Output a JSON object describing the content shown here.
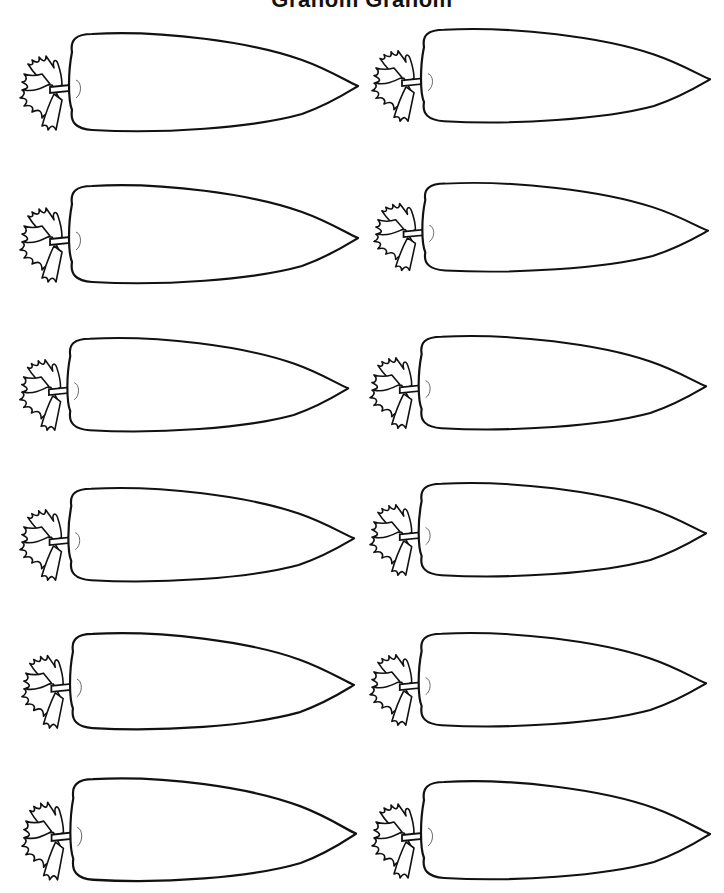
{
  "worksheet": {
    "title": "Granom Granom",
    "rows": 6,
    "columns": 2,
    "item_icon": "carrot-outline",
    "stroke_color": "#111111",
    "background_color": "#ffffff"
  },
  "carrots": [
    {
      "row": 1,
      "col": 1,
      "x": 12,
      "y": 30,
      "w": 350,
      "h": 105
    },
    {
      "row": 1,
      "col": 2,
      "x": 364,
      "y": 26,
      "w": 350,
      "h": 100
    },
    {
      "row": 2,
      "col": 1,
      "x": 12,
      "y": 182,
      "w": 350,
      "h": 105
    },
    {
      "row": 2,
      "col": 2,
      "x": 366,
      "y": 180,
      "w": 346,
      "h": 95
    },
    {
      "row": 3,
      "col": 1,
      "x": 12,
      "y": 335,
      "w": 340,
      "h": 100
    },
    {
      "row": 3,
      "col": 2,
      "x": 362,
      "y": 333,
      "w": 348,
      "h": 100
    },
    {
      "row": 4,
      "col": 1,
      "x": 12,
      "y": 485,
      "w": 346,
      "h": 100
    },
    {
      "row": 4,
      "col": 2,
      "x": 362,
      "y": 480,
      "w": 348,
      "h": 100
    },
    {
      "row": 5,
      "col": 1,
      "x": 14,
      "y": 630,
      "w": 344,
      "h": 103
    },
    {
      "row": 5,
      "col": 2,
      "x": 362,
      "y": 630,
      "w": 348,
      "h": 100
    },
    {
      "row": 6,
      "col": 1,
      "x": 14,
      "y": 775,
      "w": 346,
      "h": 110
    },
    {
      "row": 6,
      "col": 2,
      "x": 364,
      "y": 778,
      "w": 350,
      "h": 105
    }
  ]
}
